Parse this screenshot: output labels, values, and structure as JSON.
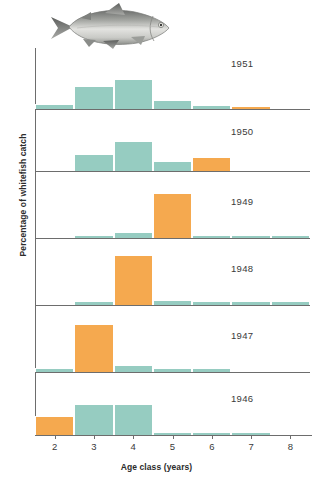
{
  "figure": {
    "illustration_name": "whitefish-illustration",
    "colors": {
      "teal": "#96ccc1",
      "orange": "#f5a94f",
      "axis": "#6d6d6d",
      "text": "#3a3a3a"
    }
  },
  "chart_data": {
    "type": "bar",
    "title": "",
    "xlabel": "Age class (years)",
    "ylabel": "Percentage of whitefish catch",
    "categories": [
      2,
      3,
      4,
      5,
      6,
      7,
      8
    ],
    "tick_labels": [
      "2",
      "3",
      "4",
      "5",
      "6",
      "7",
      "8"
    ],
    "xlim": [
      1.5,
      8.5
    ],
    "ylim": [
      0,
      100
    ],
    "grid": false,
    "legend": "none",
    "panel_layout": "stacked-small-multiples",
    "highlight_color": "#f5a94f",
    "base_color": "#96ccc1",
    "panels": [
      {
        "label": "1951",
        "values": [
          8,
          40,
          52,
          16,
          7,
          6,
          0
        ],
        "highlight_index": 5
      },
      {
        "label": "1950",
        "values": [
          0,
          30,
          52,
          17,
          24,
          0,
          0
        ],
        "highlight_index": 4
      },
      {
        "label": "1949",
        "values": [
          0,
          5,
          9,
          73,
          5,
          5,
          5
        ],
        "highlight_index": 3
      },
      {
        "label": "1948",
        "values": [
          0,
          6,
          81,
          8,
          6,
          6,
          6
        ],
        "highlight_index": 2
      },
      {
        "label": "1947",
        "values": [
          6,
          78,
          12,
          7,
          6,
          0,
          0
        ],
        "highlight_index": 1
      },
      {
        "label": "1946",
        "values": [
          33,
          53,
          53,
          6,
          6,
          6,
          0
        ],
        "highlight_index": 0
      }
    ]
  }
}
